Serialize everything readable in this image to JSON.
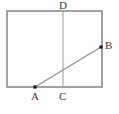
{
  "figure": {
    "name": "rectangle-with-diagonal-and-median",
    "canvas": {
      "width": 119,
      "height": 114,
      "background": "#fdfdfd"
    },
    "colors": {
      "rectangle_stroke": "#8a8a8a",
      "median_stroke": "#a6a6a6",
      "diagonal_stroke": "#8f8f8f",
      "point_fill": "#1a1a1a",
      "label_color": "#3b3b3b"
    },
    "rectangle": {
      "name": "outer-rectangle",
      "left": 7,
      "top": 11,
      "right": 102,
      "bottom": 87,
      "stroke_width": 1.6
    },
    "segments": [
      {
        "name": "segment-CD",
        "label": "CD",
        "x1": 63,
        "y1": 11,
        "x2": 63,
        "y2": 87,
        "stroke_width": 1.1
      },
      {
        "name": "segment-AB",
        "label": "AB",
        "x1": 35,
        "y1": 87,
        "x2": 101,
        "y2": 47,
        "stroke_width": 1.3
      }
    ],
    "points": [
      {
        "name": "point-A",
        "label": "A",
        "x": 35,
        "y": 87,
        "marked": true,
        "label_x": 31,
        "label_y": 91
      },
      {
        "name": "point-B",
        "label": "B",
        "x": 101,
        "y": 47,
        "marked": true,
        "label_x": 105,
        "label_y": 40
      },
      {
        "name": "point-C",
        "label": "C",
        "x": 63,
        "y": 87,
        "marked": false,
        "label_x": 59,
        "label_y": 91
      },
      {
        "name": "point-D",
        "label": "D",
        "x": 63,
        "y": 11,
        "marked": false,
        "label_x": 59,
        "label_y": 0
      }
    ],
    "point_marker_size": 3.2
  }
}
